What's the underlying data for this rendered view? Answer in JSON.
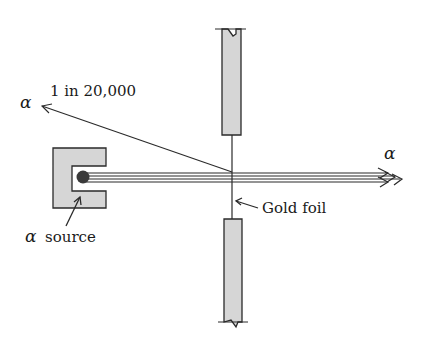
{
  "labels": {
    "scatter_fraction": "1 in 20,000",
    "alpha_scattered": "α",
    "alpha_transmitted": "α",
    "gold_foil": "Gold foil",
    "alpha_source_symbol": "α",
    "alpha_source_text": "source"
  },
  "colors": {
    "line": "#2a2a2a",
    "fill_gray": "#d6d6d6",
    "source_dot": "#3a3a3a",
    "background": "#ffffff"
  },
  "elements": {
    "source_housing": "lead block with cavity",
    "source": "alpha source (dark dot)",
    "beam": "parallel alpha-particle beam lines",
    "foil": "thin gold foil (vertical line)",
    "upper_holder": "upper foil holder (gray bar, broken top)",
    "lower_holder": "lower foil holder (gray bar, broken bottom)",
    "scattered_ray": "back-scattered alpha arrow"
  }
}
